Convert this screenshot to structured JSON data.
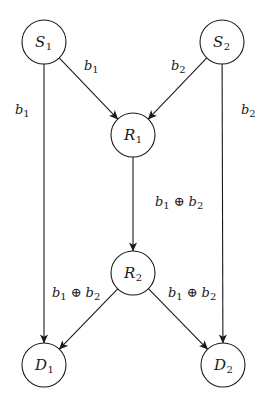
{
  "diagram": {
    "type": "network-coding-butterfly",
    "nodes": [
      {
        "id": "S1",
        "base": "S",
        "sub": "1",
        "cx": 44,
        "cy": 42,
        "r": 22
      },
      {
        "id": "S2",
        "base": "S",
        "sub": "2",
        "cx": 222,
        "cy": 42,
        "r": 22
      },
      {
        "id": "R1",
        "base": "R",
        "sub": "1",
        "cx": 133,
        "cy": 135,
        "r": 22
      },
      {
        "id": "R2",
        "base": "R",
        "sub": "2",
        "cx": 133,
        "cy": 273,
        "r": 22
      },
      {
        "id": "D1",
        "base": "D",
        "sub": "1",
        "cx": 44,
        "cy": 365,
        "r": 22
      },
      {
        "id": "D2",
        "base": "D",
        "sub": "2",
        "cx": 223,
        "cy": 365,
        "r": 22
      }
    ],
    "edges": [
      {
        "id": "S1-R1",
        "from": "S1",
        "to": "R1",
        "label": {
          "parts": [
            {
              "t": "b",
              "s": "1"
            }
          ],
          "x": 84,
          "y": 70
        }
      },
      {
        "id": "S2-R1",
        "from": "S2",
        "to": "R1",
        "label": {
          "parts": [
            {
              "t": "b",
              "s": "2"
            }
          ],
          "x": 171,
          "y": 70
        }
      },
      {
        "id": "S1-D1",
        "from": "S1",
        "to": "D1",
        "label": {
          "parts": [
            {
              "t": "b",
              "s": "1"
            }
          ],
          "x": 15,
          "y": 114
        }
      },
      {
        "id": "S2-D2",
        "from": "S2",
        "to": "D2",
        "label": {
          "parts": [
            {
              "t": "b",
              "s": "2"
            }
          ],
          "x": 241,
          "y": 114
        }
      },
      {
        "id": "R1-R2",
        "from": "R1",
        "to": "R2",
        "label": {
          "parts": [
            {
              "t": "b",
              "s": "1"
            },
            {
              "op": "⊕"
            },
            {
              "t": "b",
              "s": "2"
            }
          ],
          "x": 155,
          "y": 206
        }
      },
      {
        "id": "R2-D1",
        "from": "R2",
        "to": "D1",
        "label": {
          "parts": [
            {
              "t": "b",
              "s": "1"
            },
            {
              "op": "⊕"
            },
            {
              "t": "b",
              "s": "2"
            }
          ],
          "x": 52,
          "y": 297
        }
      },
      {
        "id": "R2-D2",
        "from": "R2",
        "to": "D2",
        "label": {
          "parts": [
            {
              "t": "b",
              "s": "1"
            },
            {
              "op": "⊕"
            },
            {
              "t": "b",
              "s": "2"
            }
          ],
          "x": 168,
          "y": 297
        }
      }
    ],
    "labels": {
      "S1": "S1",
      "S2": "S2",
      "R1": "R1",
      "R2": "R2",
      "D1": "D1",
      "D2": "D2",
      "edge_S1_R1": "b1",
      "edge_S2_R1": "b2",
      "edge_S1_D1": "b1",
      "edge_S2_D2": "b2",
      "edge_R1_R2": "b1 ⊕ b2",
      "edge_R2_D1": "b1 ⊕ b2",
      "edge_R2_D2": "b1 ⊕ b2"
    },
    "colors": {
      "stroke": "#1a1a1a",
      "background": "#ffffff"
    }
  }
}
